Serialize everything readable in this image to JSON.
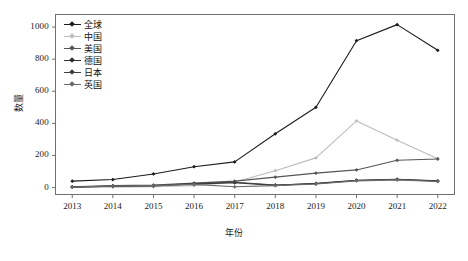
{
  "chart_data": {
    "type": "line",
    "title": "",
    "xlabel": "年份",
    "ylabel": "数量",
    "x": [
      2013,
      2014,
      2015,
      2016,
      2017,
      2018,
      2019,
      2020,
      2021,
      2022
    ],
    "categories": [
      "2013",
      "2014",
      "2015",
      "2016",
      "2017",
      "2018",
      "2019",
      "2020",
      "2021",
      "2022"
    ],
    "xlim": [
      2012.6,
      2022.4
    ],
    "ylim": [
      -40,
      1075
    ],
    "yticks": [
      0,
      200,
      400,
      600,
      800,
      1000
    ],
    "ytick_labels": [
      "0",
      "200",
      "400",
      "600",
      "800",
      "1000"
    ],
    "grid": false,
    "legend_position": "upper-left",
    "series": [
      {
        "name": "全球",
        "color": "#1b1b1b",
        "marker": "diamond",
        "values": [
          40,
          50,
          85,
          130,
          160,
          335,
          500,
          915,
          1015,
          855
        ]
      },
      {
        "name": "中国",
        "color": "#bcbcbc",
        "marker": "diamond",
        "values": [
          2,
          3,
          5,
          12,
          35,
          105,
          185,
          415,
          295,
          180
        ]
      },
      {
        "name": "美国",
        "color": "#555555",
        "marker": "diamond",
        "values": [
          5,
          12,
          15,
          28,
          40,
          65,
          90,
          110,
          170,
          178
        ]
      },
      {
        "name": "德国",
        "color": "#2e2e2e",
        "marker": "diamond",
        "values": [
          3,
          8,
          10,
          22,
          30,
          14,
          26,
          46,
          52,
          42
        ]
      },
      {
        "name": "日本",
        "color": "#3f3f3f",
        "marker": "diamond",
        "values": [
          4,
          10,
          13,
          25,
          33,
          16,
          24,
          44,
          50,
          40
        ]
      },
      {
        "name": "英国",
        "color": "#6a6a6a",
        "marker": "diamond",
        "values": [
          3,
          9,
          12,
          20,
          5,
          12,
          22,
          42,
          48,
          38
        ]
      }
    ]
  },
  "legend": {
    "items": [
      {
        "label": "全球"
      },
      {
        "label": "中国"
      },
      {
        "label": "美国"
      },
      {
        "label": "德国"
      },
      {
        "label": "日本"
      },
      {
        "label": "英国"
      }
    ]
  },
  "axes": {
    "x_title": "年份",
    "y_title": "数量"
  }
}
